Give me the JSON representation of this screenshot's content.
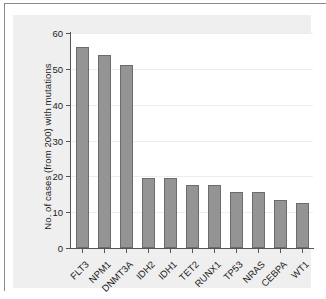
{
  "figure": {
    "panel_background": "#efefef",
    "plot_background": "#ffffff",
    "frame_color": "#8a8a8a"
  },
  "chart_data": {
    "type": "bar",
    "title": "",
    "xlabel": "",
    "ylabel": "No. of cases (from 200) with mutations",
    "ylim": [
      0,
      60
    ],
    "yticks": [
      0,
      10,
      20,
      30,
      40,
      50,
      60
    ],
    "ytick_labels": [
      "0",
      "10",
      "20",
      "30",
      "40",
      "50",
      "60"
    ],
    "grid": true,
    "grid_axis": "y",
    "legend": false,
    "bar_color": "#949494",
    "bar_edge_color": "#6c6c6c",
    "categories": [
      "FLT3",
      "NPM1",
      "DNMT3A",
      "IDH2",
      "IDH1",
      "TET2",
      "RUNX1",
      "TP53",
      "NRAS",
      "CEBPA",
      "WT1"
    ],
    "values": [
      56,
      54,
      51,
      19.5,
      19.5,
      17.5,
      17.5,
      15.5,
      15.5,
      13.5,
      12.5
    ]
  }
}
